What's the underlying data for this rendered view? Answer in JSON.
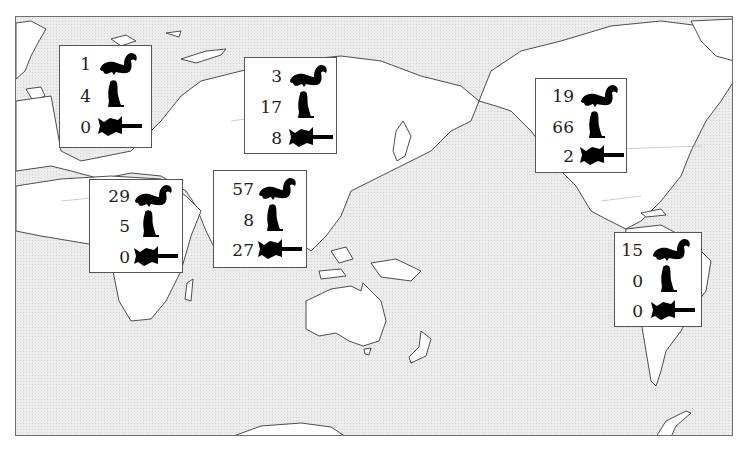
{
  "map": {
    "projection": "pacific-centered world map",
    "ocean_color": "#ececec",
    "land_color": "#ffffff",
    "outline_color": "#3a3a3a"
  },
  "legend_icons": {
    "squirrel": "tree-squirrel-icon",
    "marmot": "ground-squirrel-icon",
    "flying_squirrel": "flying-squirrel-icon"
  },
  "regions": [
    {
      "id": "europe",
      "squirrel": "1",
      "marmot": "4",
      "flying_squirrel": "0"
    },
    {
      "id": "africa",
      "squirrel": "29",
      "marmot": "5",
      "flying_squirrel": "0"
    },
    {
      "id": "south-asia",
      "squirrel": "57",
      "marmot": "8",
      "flying_squirrel": "27"
    },
    {
      "id": "north-asia",
      "squirrel": "3",
      "marmot": "17",
      "flying_squirrel": "8"
    },
    {
      "id": "north-america",
      "squirrel": "19",
      "marmot": "66",
      "flying_squirrel": "2"
    },
    {
      "id": "south-america",
      "squirrel": "15",
      "marmot": "0",
      "flying_squirrel": "0"
    }
  ]
}
